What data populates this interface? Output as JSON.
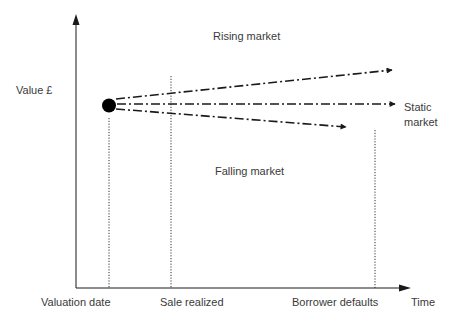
{
  "axes": {
    "y_label": "Value £",
    "x_label": "Time"
  },
  "regions": {
    "rising": "Rising market",
    "static_line1": "Static",
    "static_line2": "market",
    "falling": "Falling market"
  },
  "time_markers": [
    {
      "label": "Valuation date"
    },
    {
      "label": "Sale realized"
    },
    {
      "label": "Borrower defaults"
    }
  ],
  "colors": {
    "line": "#1a1a1a",
    "text": "#3a3a3a",
    "dot": "#000000"
  }
}
